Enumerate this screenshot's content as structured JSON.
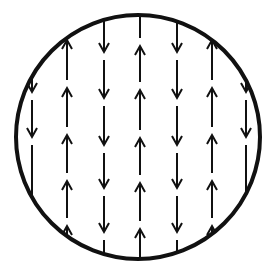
{
  "diagram": {
    "background": "#ffffff",
    "stroke_color": "#111111",
    "circle": {
      "cx": 138,
      "cy": 137,
      "r": 122,
      "stroke_width": 4
    },
    "arrow_head": {
      "half_width": 5,
      "length": 9
    },
    "columns": [
      {
        "x": 32,
        "direction": "down",
        "heads": [
          92,
          137
        ]
      },
      {
        "x": 67,
        "direction": "up",
        "heads": [
          40,
          88,
          135,
          181,
          226
        ]
      },
      {
        "x": 104,
        "direction": "down",
        "heads": [
          52,
          98,
          145,
          188,
          232
        ]
      },
      {
        "x": 140,
        "direction": "up",
        "heads": [
          46,
          90,
          138,
          183,
          229
        ]
      },
      {
        "x": 177,
        "direction": "down",
        "heads": [
          52,
          98,
          145,
          188,
          232
        ]
      },
      {
        "x": 212,
        "direction": "up",
        "heads": [
          40,
          88,
          135,
          181,
          226
        ]
      },
      {
        "x": 246,
        "direction": "down",
        "heads": [
          92,
          137
        ]
      }
    ]
  }
}
